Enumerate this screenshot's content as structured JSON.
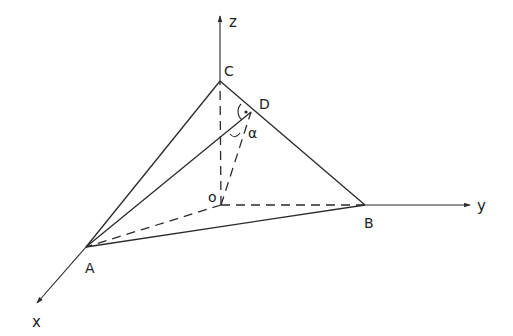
{
  "diagram": {
    "type": "3D coordinate geometry figure (tetrahedron OABC)",
    "axes": {
      "x_label": "x",
      "y_label": "y",
      "z_label": "z"
    },
    "points": {
      "O": "o",
      "A": "A",
      "B": "B",
      "C": "C",
      "D": "D"
    },
    "angle_label": "α",
    "right_angle_mark_at": "D",
    "solid_edges": [
      "AC",
      "AB",
      "BC",
      "AD"
    ],
    "dashed_edges": [
      "OA",
      "OB",
      "OC",
      "OD"
    ],
    "colors": {
      "stroke": "#2a2a2a",
      "background": "#ffffff"
    }
  }
}
